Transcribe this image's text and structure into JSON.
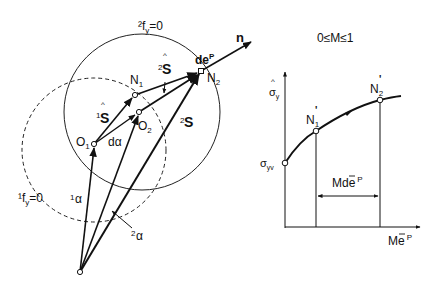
{
  "left_diagram": {
    "yield_surface_2": "²f",
    "yield_surface_2_sub": "y",
    "yield_surface_2_eq": "=0",
    "yield_surface_1": "¹f",
    "yield_surface_1_sub": "y",
    "yield_surface_1_eq": "=0",
    "normal": "n",
    "plastic_strain": "de",
    "plastic_strain_sup": "P",
    "point_N1": "N",
    "point_N1_sub": "1",
    "point_N2": "N",
    "point_N2_sub": "2",
    "point_O1": "O",
    "point_O1_sub": "1",
    "point_O2": "O",
    "point_O2_sub": "2",
    "stress_1hat_pre": "1",
    "stress_1hat": "S",
    "stress_2hat_pre": "2",
    "stress_2hat": "S",
    "stress_2_pre": "2",
    "stress_2": "S",
    "d_alpha": "dα",
    "alpha_1_pre": "1",
    "alpha_1": "α",
    "alpha_2_pre": "2",
    "alpha_2": "α",
    "hat": "^"
  },
  "right_diagram": {
    "title": "0≤M≤1",
    "y_axis": "σ",
    "y_axis_sub": "y",
    "y_axis_hat": "^",
    "y0_label": "σ",
    "y0_sub": "yv",
    "point_N1p": "N",
    "point_N1p_sub": "1",
    "point_N2p": "N",
    "point_N2p_sub": "2",
    "prime": "'",
    "interval_label": "Mde",
    "interval_sup": "P",
    "x_axis": "Me",
    "x_axis_sup": "P",
    "bar": "¯"
  }
}
